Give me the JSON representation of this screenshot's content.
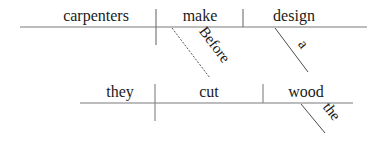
{
  "diagram": {
    "type": "sentence-diagram",
    "line_color": "#7a7a7a",
    "text_color": "#1a1a1a",
    "clauses": [
      {
        "name": "main-clause",
        "subject": "carpenters",
        "verb": "make",
        "object": "design",
        "modifiers": [
          {
            "word": "a",
            "modifies": "design",
            "line_style": "solid"
          }
        ]
      },
      {
        "name": "subordinate-clause",
        "connector": {
          "word": "Before",
          "line_style": "dashed",
          "connects": [
            "make",
            "cut"
          ]
        },
        "subject": "they",
        "verb": "cut",
        "object": "wood",
        "modifiers": [
          {
            "word": "the",
            "modifies": "wood",
            "line_style": "solid"
          }
        ]
      }
    ]
  }
}
